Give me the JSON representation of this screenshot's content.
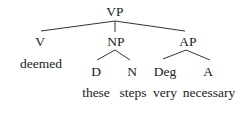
{
  "tree": {
    "root": {
      "label": "VP",
      "x": 115,
      "y": 12
    },
    "nodes": [
      {
        "id": "V",
        "label": "V",
        "x": 40,
        "y": 42
      },
      {
        "id": "NP",
        "label": "NP",
        "x": 116,
        "y": 42
      },
      {
        "id": "AP",
        "label": "AP",
        "x": 188,
        "y": 42
      },
      {
        "id": "D",
        "label": "D",
        "x": 96,
        "y": 72
      },
      {
        "id": "N",
        "label": "N",
        "x": 132,
        "y": 72
      },
      {
        "id": "Deg",
        "label": "Deg",
        "x": 165,
        "y": 72
      },
      {
        "id": "A",
        "label": "A",
        "x": 208,
        "y": 72
      }
    ],
    "words": [
      {
        "label": "deemed",
        "x": 41,
        "y": 64
      },
      {
        "label": "these",
        "x": 96,
        "y": 93
      },
      {
        "label": "steps",
        "x": 133,
        "y": 93
      },
      {
        "label": "very",
        "x": 165,
        "y": 93
      },
      {
        "label": "necessary",
        "x": 209,
        "y": 93
      }
    ],
    "edges": [
      {
        "from": "VP",
        "to": "V"
      },
      {
        "from": "VP",
        "to": "NP"
      },
      {
        "from": "VP",
        "to": "AP"
      },
      {
        "from": "NP",
        "to": "D"
      },
      {
        "from": "NP",
        "to": "N"
      },
      {
        "from": "AP",
        "to": "Deg"
      },
      {
        "from": "AP",
        "to": "A"
      }
    ],
    "line_color": "#333333"
  }
}
